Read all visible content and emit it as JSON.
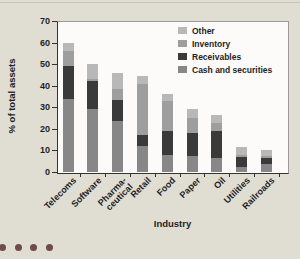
{
  "page": {
    "background": "#e0ddd3",
    "top_line_color": "#c7c4b9"
  },
  "decor": {
    "dot_color": "#6d4c49",
    "dot_count": 4
  },
  "chart_data": {
    "type": "bar",
    "stacked": true,
    "title": "",
    "xlabel": "Industry",
    "ylabel": "% of total assets",
    "ylim": [
      0,
      70
    ],
    "yticks": [
      0,
      10,
      20,
      30,
      40,
      50,
      60,
      70
    ],
    "grid": false,
    "legend_position": "inside top-right",
    "legend_order": [
      "Other",
      "Inventory",
      "Receivables",
      "Cash and securities"
    ],
    "categories": [
      "Telecoms",
      "Software",
      "Pharma-\nceutical",
      "Retail",
      "Food",
      "Paper",
      "Oil",
      "Utilities",
      "Railroads"
    ],
    "series": [
      {
        "name": "Cash and securities",
        "color": "#878787",
        "values": [
          34,
          29,
          23.5,
          12,
          8,
          7.5,
          6.5,
          2.5,
          3.5
        ]
      },
      {
        "name": "Receivables",
        "color": "#3a3a3a",
        "values": [
          15,
          13,
          10,
          5,
          11,
          10.5,
          12.5,
          4.5,
          3
        ]
      },
      {
        "name": "Inventory",
        "color": "#9e9e9e",
        "values": [
          7,
          1,
          5,
          24,
          14,
          7,
          3.5,
          1,
          1
        ]
      },
      {
        "name": "Other",
        "color": "#b8b8b8",
        "values": [
          4,
          7,
          7.5,
          3.5,
          3,
          4,
          4,
          3.5,
          2.5
        ]
      }
    ],
    "bar_totals": [
      60,
      50,
      46,
      44.5,
      36,
      29,
      26.5,
      11.5,
      10
    ]
  }
}
